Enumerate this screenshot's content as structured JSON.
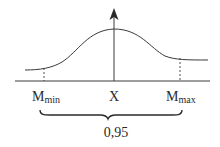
{
  "diagram": {
    "type": "normal-distribution-confidence-interval",
    "labels": {
      "left_bound": "M",
      "left_bound_sub": "min",
      "center": "X",
      "right_bound": "M",
      "right_bound_sub": "max",
      "interval_probability": "0,95"
    },
    "colors": {
      "stroke": "#3a3a3a",
      "text": "#2a2a2a",
      "background": "#ffffff"
    }
  }
}
